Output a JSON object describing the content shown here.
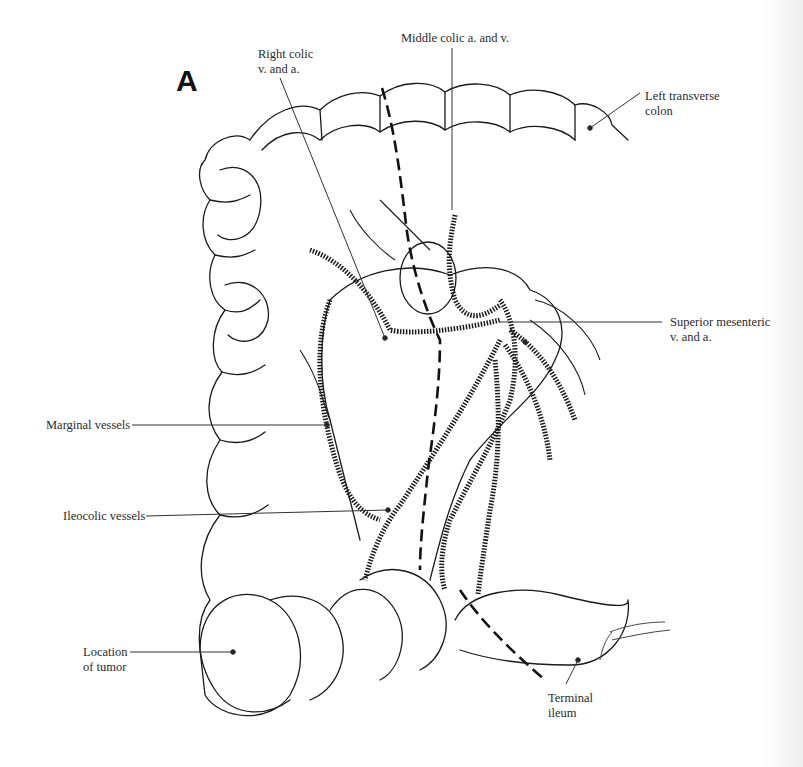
{
  "figure": {
    "panel_letter": "A",
    "signature": "J. Dougherty",
    "labels": {
      "right_colic": [
        "Right colic",
        "v. and a."
      ],
      "middle_colic": [
        "Middle colic a. and v."
      ],
      "left_transverse_colon": [
        "Left transverse",
        "colon"
      ],
      "superior_mesenteric": [
        "Superior mesenteric",
        "v. and a."
      ],
      "marginal_vessels": [
        "Marginal vessels"
      ],
      "ileocolic_vessels": [
        "Ileocolic vessels"
      ],
      "location_of_tumor": [
        "Location",
        "of tumor"
      ],
      "terminal_ileum": [
        "Terminal",
        "ileum"
      ]
    },
    "colors": {
      "line": "#1a1a1a",
      "leader": "#333333",
      "background": "#ffffff"
    }
  }
}
